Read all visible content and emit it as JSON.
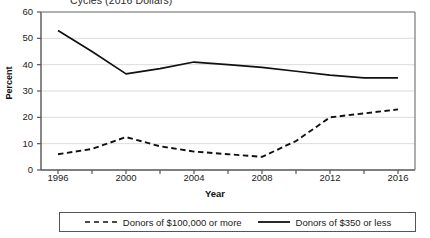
{
  "chart_data": {
    "type": "line",
    "title": "Cycles (2016 Dollars)",
    "xlabel": "Year",
    "ylabel": "Percent",
    "xlim": [
      1995,
      2017
    ],
    "ylim": [
      0,
      60
    ],
    "ytick_labels": [
      "0",
      "10",
      "20",
      "30",
      "40",
      "50",
      "60"
    ],
    "ytick_values": [
      0,
      10,
      20,
      30,
      40,
      50,
      60
    ],
    "xtick_labels": [
      "1996",
      "2000",
      "2004",
      "2008",
      "2012",
      "2016"
    ],
    "xtick_values": [
      1996,
      2000,
      2004,
      2008,
      2012,
      2016
    ],
    "x": [
      1996,
      1998,
      2000,
      2002,
      2004,
      2006,
      2008,
      2010,
      2012,
      2014,
      2016
    ],
    "grid": "horizontal",
    "legend_position": "bottom",
    "series": [
      {
        "name": "Donors of $100,000 or more",
        "style": "dashed",
        "color": "#111111",
        "values": [
          6,
          8,
          12.5,
          9,
          7,
          6,
          5,
          11,
          20,
          21.5,
          23
        ]
      },
      {
        "name": "Donors of $350 or less",
        "style": "solid",
        "color": "#111111",
        "values": [
          53,
          45,
          36.5,
          38.5,
          41,
          40,
          39,
          37.5,
          36,
          35,
          35
        ]
      }
    ]
  },
  "legend": {
    "entries": [
      {
        "label": "Donors of $100,000 or more",
        "style": "dashed"
      },
      {
        "label": "Donors of $350 or less",
        "style": "solid"
      }
    ]
  }
}
